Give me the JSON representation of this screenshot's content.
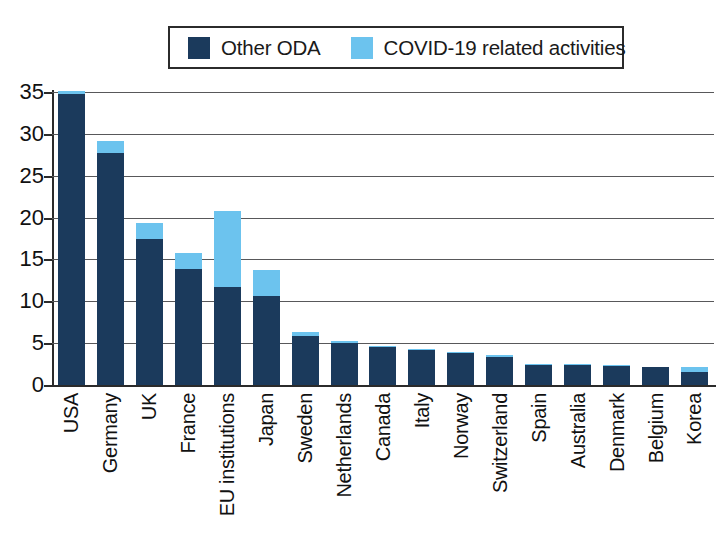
{
  "chart_data": {
    "type": "bar",
    "subtype": "stacked",
    "title": "",
    "xlabel": "",
    "ylabel": "",
    "ylim": [
      0,
      35
    ],
    "ytick_step": 5,
    "yticks": [
      "35",
      "30",
      "25",
      "20",
      "15",
      "10",
      "5",
      "0"
    ],
    "grid": true,
    "legend_position": "top-center",
    "colors": {
      "other_oda": "#1B3A5C",
      "covid": "#6CC3EE",
      "axis": "#2b2b2b",
      "gridline": "#58585a",
      "background": "#ffffff"
    },
    "categories": [
      "USA",
      "Germany",
      "UK",
      "France",
      "EU institutions",
      "Japan",
      "Sweden",
      "Netherlands",
      "Canada",
      "Italy",
      "Norway",
      "Switzerland",
      "Spain",
      "Australia",
      "Denmark",
      "Belgium",
      "Korea"
    ],
    "series": [
      {
        "name": "Other ODA",
        "color": "#1B3A5C",
        "values": [
          34.8,
          27.7,
          17.5,
          13.8,
          11.7,
          10.6,
          5.9,
          5.0,
          4.5,
          4.2,
          3.8,
          3.4,
          2.4,
          2.4,
          2.3,
          2.1,
          1.5
        ]
      },
      {
        "name": "COVID-19 related activities",
        "color": "#6CC3EE",
        "values": [
          0.3,
          1.4,
          1.9,
          2.0,
          9.1,
          3.1,
          0.4,
          0.3,
          0.2,
          0.1,
          0.1,
          0.2,
          0.1,
          0.1,
          0.1,
          0.1,
          0.7
        ]
      }
    ],
    "totals": [
      35.1,
      29.1,
      19.4,
      15.8,
      20.8,
      13.7,
      6.3,
      5.3,
      4.7,
      4.3,
      3.9,
      3.6,
      2.5,
      2.5,
      2.4,
      2.2,
      2.2
    ]
  },
  "legend": {
    "items": [
      {
        "label": "Other ODA",
        "color": "#1B3A5C"
      },
      {
        "label": "COVID-19 related activities",
        "color": "#6CC3EE"
      }
    ]
  }
}
